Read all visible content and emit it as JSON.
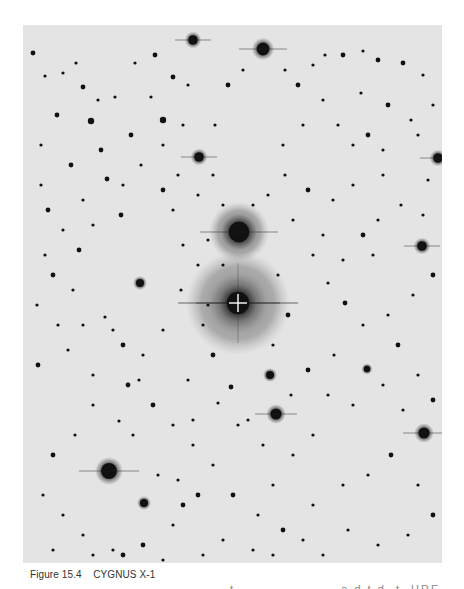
{
  "figure": {
    "caption": "Figure 15.4    CYGNUS X-1",
    "clipped_text": "t                     a d t d  t  HRE",
    "plate": {
      "background": "#e4e4e4",
      "star_color": "#111111",
      "crosshair_color": "#ffffff",
      "target": {
        "x": 215,
        "y": 278,
        "label": "crosshair-marker"
      },
      "halos": [
        {
          "x": 216,
          "y": 207,
          "r": 30,
          "opacity": 0.55
        },
        {
          "x": 215,
          "y": 278,
          "r": 52,
          "opacity": 0.5
        },
        {
          "x": 215,
          "y": 278,
          "r": 30,
          "opacity": 0.45
        }
      ],
      "bright_stars": [
        {
          "x": 216,
          "y": 207,
          "r": 13
        },
        {
          "x": 215,
          "y": 278,
          "r": 14
        },
        {
          "x": 240,
          "y": 24,
          "r": 8
        },
        {
          "x": 170,
          "y": 15,
          "r": 6
        },
        {
          "x": 86,
          "y": 446,
          "r": 10
        },
        {
          "x": 401,
          "y": 408,
          "r": 7
        },
        {
          "x": 399,
          "y": 221,
          "r": 6
        },
        {
          "x": 253,
          "y": 389,
          "r": 7
        },
        {
          "x": 176,
          "y": 132,
          "r": 6
        },
        {
          "x": 117,
          "y": 258,
          "r": 5
        },
        {
          "x": 415,
          "y": 133,
          "r": 6
        },
        {
          "x": 344,
          "y": 344,
          "r": 4
        },
        {
          "x": 247,
          "y": 350,
          "r": 5
        },
        {
          "x": 121,
          "y": 478,
          "r": 5
        }
      ],
      "stars": [
        [
          10,
          28,
          3
        ],
        [
          22,
          51,
          2
        ],
        [
          40,
          48,
          2
        ],
        [
          53,
          38,
          2
        ],
        [
          60,
          62,
          3
        ],
        [
          75,
          75,
          2
        ],
        [
          92,
          72,
          2
        ],
        [
          108,
          110,
          3
        ],
        [
          34,
          90,
          3
        ],
        [
          48,
          140,
          3
        ],
        [
          68,
          96,
          4
        ],
        [
          84,
          154,
          3
        ],
        [
          112,
          38,
          2
        ],
        [
          132,
          30,
          3
        ],
        [
          150,
          52,
          3
        ],
        [
          165,
          60,
          2
        ],
        [
          128,
          72,
          2
        ],
        [
          140,
          95,
          4
        ],
        [
          160,
          100,
          2
        ],
        [
          118,
          140,
          2
        ],
        [
          100,
          160,
          2
        ],
        [
          78,
          125,
          3
        ],
        [
          60,
          175,
          2
        ],
        [
          40,
          205,
          2
        ],
        [
          22,
          230,
          2
        ],
        [
          14,
          280,
          2
        ],
        [
          30,
          250,
          3
        ],
        [
          50,
          265,
          2
        ],
        [
          82,
          292,
          2
        ],
        [
          100,
          320,
          3
        ],
        [
          120,
          330,
          2
        ],
        [
          140,
          305,
          2
        ],
        [
          158,
          265,
          2
        ],
        [
          160,
          220,
          2
        ],
        [
          150,
          185,
          2
        ],
        [
          175,
          170,
          2
        ],
        [
          190,
          150,
          2
        ],
        [
          192,
          100,
          2
        ],
        [
          205,
          60,
          3
        ],
        [
          220,
          45,
          2
        ],
        [
          262,
          45,
          2
        ],
        [
          275,
          60,
          3
        ],
        [
          290,
          40,
          2
        ],
        [
          302,
          30,
          2
        ],
        [
          320,
          30,
          3
        ],
        [
          340,
          26,
          2
        ],
        [
          355,
          35,
          3
        ],
        [
          380,
          38,
          3
        ],
        [
          400,
          50,
          2
        ],
        [
          410,
          80,
          2
        ],
        [
          388,
          95,
          2
        ],
        [
          365,
          80,
          3
        ],
        [
          338,
          68,
          2
        ],
        [
          300,
          75,
          2
        ],
        [
          280,
          100,
          2
        ],
        [
          260,
          120,
          2
        ],
        [
          285,
          165,
          3
        ],
        [
          310,
          175,
          2
        ],
        [
          330,
          160,
          2
        ],
        [
          360,
          150,
          2
        ],
        [
          378,
          180,
          2
        ],
        [
          400,
          190,
          2
        ],
        [
          410,
          250,
          3
        ],
        [
          390,
          270,
          2
        ],
        [
          365,
          290,
          2
        ],
        [
          340,
          300,
          2
        ],
        [
          322,
          278,
          3
        ],
        [
          305,
          258,
          2
        ],
        [
          290,
          230,
          2
        ],
        [
          270,
          195,
          2
        ],
        [
          262,
          150,
          2
        ],
        [
          300,
          210,
          2
        ],
        [
          350,
          230,
          2
        ],
        [
          375,
          320,
          3
        ],
        [
          395,
          350,
          2
        ],
        [
          410,
          375,
          3
        ],
        [
          380,
          385,
          2
        ],
        [
          360,
          360,
          2
        ],
        [
          330,
          380,
          2
        ],
        [
          305,
          370,
          2
        ],
        [
          290,
          410,
          2
        ],
        [
          270,
          430,
          2
        ],
        [
          250,
          460,
          2
        ],
        [
          235,
          490,
          2
        ],
        [
          210,
          470,
          3
        ],
        [
          190,
          440,
          2
        ],
        [
          170,
          420,
          2
        ],
        [
          150,
          400,
          2
        ],
        [
          130,
          380,
          3
        ],
        [
          110,
          410,
          2
        ],
        [
          96,
          396,
          2
        ],
        [
          70,
          380,
          2
        ],
        [
          52,
          410,
          2
        ],
        [
          30,
          430,
          3
        ],
        [
          20,
          470,
          2
        ],
        [
          40,
          490,
          2
        ],
        [
          60,
          510,
          2
        ],
        [
          90,
          525,
          2
        ],
        [
          120,
          520,
          3
        ],
        [
          150,
          500,
          2
        ],
        [
          175,
          470,
          3
        ],
        [
          200,
          515,
          2
        ],
        [
          230,
          525,
          2
        ],
        [
          260,
          505,
          3
        ],
        [
          290,
          480,
          2
        ],
        [
          320,
          460,
          2
        ],
        [
          345,
          450,
          2
        ],
        [
          368,
          430,
          3
        ],
        [
          395,
          460,
          2
        ],
        [
          410,
          490,
          3
        ],
        [
          385,
          510,
          2
        ],
        [
          355,
          520,
          2
        ],
        [
          325,
          505,
          2
        ],
        [
          300,
          530,
          2
        ],
        [
          280,
          515,
          2
        ],
        [
          250,
          530,
          2
        ],
        [
          180,
          530,
          2
        ],
        [
          140,
          535,
          2
        ],
        [
          100,
          530,
          3
        ],
        [
          70,
          530,
          2
        ],
        [
          30,
          525,
          2
        ],
        [
          15,
          340,
          3
        ],
        [
          45,
          325,
          2
        ],
        [
          70,
          350,
          2
        ],
        [
          90,
          305,
          2
        ],
        [
          190,
          330,
          3
        ],
        [
          180,
          300,
          2
        ],
        [
          250,
          320,
          2
        ],
        [
          265,
          290,
          3
        ],
        [
          255,
          250,
          2
        ],
        [
          200,
          240,
          2
        ],
        [
          175,
          240,
          2
        ],
        [
          185,
          280,
          2
        ],
        [
          230,
          180,
          2
        ],
        [
          245,
          170,
          2
        ],
        [
          200,
          180,
          2
        ],
        [
          140,
          120,
          2
        ],
        [
          98,
          190,
          3
        ],
        [
          70,
          200,
          2
        ],
        [
          56,
          225,
          3
        ],
        [
          35,
          300,
          2
        ],
        [
          60,
          300,
          2
        ],
        [
          105,
          360,
          3
        ],
        [
          116,
          355,
          2
        ],
        [
          165,
          355,
          2
        ],
        [
          208,
          362,
          3
        ],
        [
          225,
          395,
          2
        ],
        [
          268,
          370,
          2
        ],
        [
          285,
          345,
          3
        ],
        [
          311,
          330,
          2
        ],
        [
          240,
          420,
          2
        ],
        [
          215,
          400,
          2
        ],
        [
          195,
          378,
          2
        ],
        [
          170,
          395,
          2
        ],
        [
          135,
          450,
          2
        ],
        [
          155,
          455,
          2
        ],
        [
          160,
          480,
          3
        ],
        [
          330,
          120,
          2
        ],
        [
          315,
          100,
          2
        ],
        [
          345,
          110,
          3
        ],
        [
          360,
          125,
          2
        ],
        [
          395,
          110,
          2
        ],
        [
          405,
          155,
          2
        ],
        [
          355,
          195,
          2
        ],
        [
          340,
          210,
          3
        ],
        [
          320,
          235,
          2
        ],
        [
          18,
          120,
          2
        ],
        [
          18,
          160,
          2
        ],
        [
          25,
          185,
          3
        ],
        [
          140,
          165,
          3
        ],
        [
          155,
          150,
          2
        ],
        [
          185,
          215,
          2
        ]
      ]
    }
  }
}
